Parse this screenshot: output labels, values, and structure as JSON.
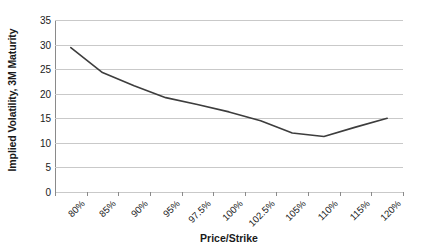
{
  "chart_data": {
    "type": "line",
    "title": "",
    "xlabel": "Price/Strike",
    "ylabel": "Implied Volatility, 3M Maturity",
    "categories": [
      "80%",
      "85%",
      "90%",
      "95%",
      "97.5%",
      "100%",
      "102.5%",
      "105%",
      "110%",
      "115%",
      "120%"
    ],
    "values": [
      29.4,
      24.3,
      21.6,
      19.2,
      17.8,
      16.3,
      14.5,
      12.0,
      11.3,
      13.2,
      15.0
    ],
    "series": [
      {
        "name": "Implied Volatility",
        "values": [
          29.4,
          24.3,
          21.6,
          19.2,
          17.8,
          16.3,
          14.5,
          12.0,
          11.3,
          13.2,
          15.0
        ]
      }
    ],
    "ylim": [
      0,
      35
    ],
    "y_ticks": [
      0,
      5,
      10,
      15,
      20,
      25,
      30,
      35
    ],
    "y_tick_labels": [
      "0",
      "5",
      "10",
      "15",
      "20",
      "25",
      "30",
      "35"
    ],
    "grid": true,
    "grid_axis": "y",
    "legend": false,
    "legend_position": "none",
    "line_color": "#3d3d3d",
    "grid_color": "#c9c9c9",
    "axis_color": "#8a8a8a",
    "text_color": "#1a1a1a",
    "background_color": "#ffffff"
  },
  "axes": {
    "y_title": "Implied Volatility, 3M Maturity",
    "x_title": "Price/Strike"
  }
}
